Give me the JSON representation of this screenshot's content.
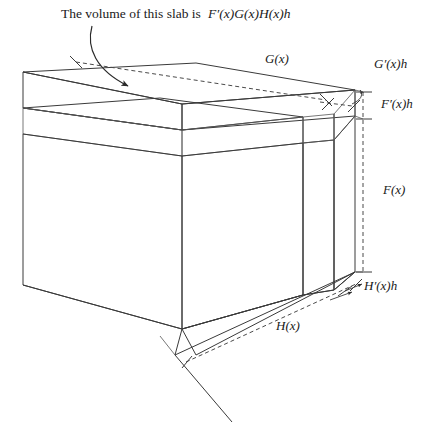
{
  "figure": {
    "type": "diagram",
    "caption": {
      "prefix": "The volume of this slab is ",
      "expression": "F′(x)G(x)H(x)h"
    },
    "labels": {
      "g_of_x": "G(x)",
      "g_prime_h": "G′(x)h",
      "f_prime_h": "F′(x)h",
      "f_of_x": "F(x)",
      "h_prime_h": "H′(x)h",
      "h_of_x": "H(x)"
    },
    "colors": {
      "body_fill": "#8c8c8c",
      "top_slab_fill": "#d0d0d0",
      "side_slab_fill": "#ffffff",
      "edge_stroke": "#3a3a3a",
      "text": "#1a1a1a",
      "background": "#ffffff"
    },
    "parts": [
      {
        "name": "main-box",
        "meaning": "Volume F(x)G(x)H(x)",
        "fill": "#8c8c8c"
      },
      {
        "name": "top-slab",
        "meaning": "Volume F′(x)G(x)H(x)h",
        "fill": "#d0d0d0"
      },
      {
        "name": "right-slab",
        "meaning": "Volume F(x)G′(x)H(x)h",
        "fill": "#ffffff"
      },
      {
        "name": "front-slab",
        "meaning": "Volume F(x)G(x)H′(x)h",
        "fill": "#ffffff"
      }
    ]
  }
}
